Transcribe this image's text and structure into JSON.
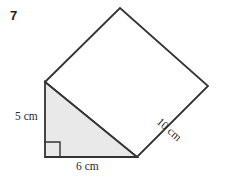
{
  "figure": {
    "problem_number": "7",
    "shapes": {
      "triangle": {
        "name": "shaded-right-triangle",
        "fill": "#e9e9e9",
        "stroke": "#333333",
        "points": "45,82 45,157 137,157"
      },
      "square": {
        "name": "white-square",
        "fill": "#ffffff",
        "stroke": "#333333",
        "points": "45,82 120,8 208,86 137,157"
      },
      "right_angle_mark": {
        "name": "right-angle-marker",
        "stroke": "#333333",
        "points": "45,142 60,142 60,157"
      }
    },
    "labels": {
      "left_leg": "5 cm",
      "bottom_leg": "6 cm",
      "hypotenuse_square_side": "10 cm"
    },
    "colors": {
      "background": "#ffffff",
      "outline": "#333333",
      "shading": "#e9e9e9",
      "text": "#2a2a2a",
      "number_text": "#1b1b1b"
    }
  }
}
